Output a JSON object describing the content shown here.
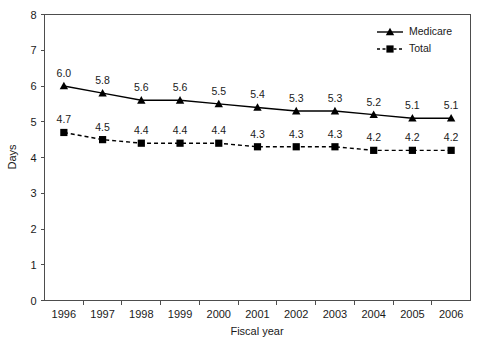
{
  "chart_data": {
    "type": "line",
    "title": "",
    "xlabel": "Fiscal year",
    "ylabel": "Days",
    "categories": [
      "1996",
      "1997",
      "1998",
      "1999",
      "2000",
      "2001",
      "2002",
      "2003",
      "2004",
      "2005",
      "2006"
    ],
    "ylim": [
      0,
      8
    ],
    "yticks": [
      "0",
      "1",
      "2",
      "3",
      "4",
      "5",
      "6",
      "7",
      "8"
    ],
    "grid": false,
    "legend_position": "top-right",
    "series": [
      {
        "name": "Medicare",
        "marker": "triangle",
        "line_style": "solid",
        "color": "#000000",
        "values": [
          6.0,
          5.8,
          5.6,
          5.6,
          5.5,
          5.4,
          5.3,
          5.3,
          5.2,
          5.1,
          5.1
        ],
        "labels": [
          "6.0",
          "5.8",
          "5.6",
          "5.6",
          "5.5",
          "5.4",
          "5.3",
          "5.3",
          "5.2",
          "5.1",
          "5.1"
        ]
      },
      {
        "name": "Total",
        "marker": "square",
        "line_style": "dashed",
        "color": "#000000",
        "values": [
          4.7,
          4.5,
          4.4,
          4.4,
          4.4,
          4.3,
          4.3,
          4.3,
          4.2,
          4.2,
          4.2
        ],
        "labels": [
          "4.7",
          "4.5",
          "4.4",
          "4.4",
          "4.4",
          "4.3",
          "4.3",
          "4.3",
          "4.2",
          "4.2",
          "4.2"
        ]
      }
    ]
  },
  "legend": {
    "items": [
      {
        "label": "Medicare"
      },
      {
        "label": "Total"
      }
    ]
  },
  "axes": {
    "y_title": "Days",
    "x_title": "Fiscal year"
  }
}
